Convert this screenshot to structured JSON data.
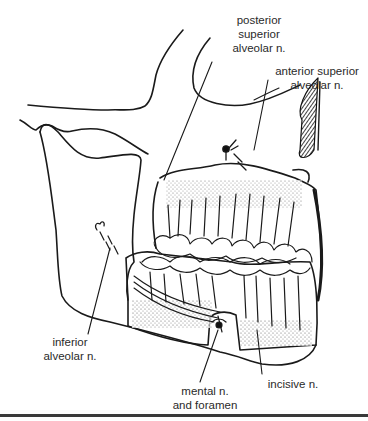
{
  "figure": {
    "labels": [
      {
        "id": "posterior_superior_alveolar",
        "lines": [
          "posterior",
          "superior",
          "alveolar n."
        ]
      },
      {
        "id": "anterior_superior_alveolar",
        "lines": [
          "anterior superior",
          "alveolar n."
        ]
      },
      {
        "id": "inferior_alveolar",
        "lines": [
          "inferior",
          "alveolar n."
        ]
      },
      {
        "id": "mental",
        "lines": [
          "mental n.",
          "and foramen"
        ]
      },
      {
        "id": "incisive",
        "lines": [
          "incisive n."
        ]
      }
    ]
  },
  "colors": {
    "line": "#1a1a1a",
    "text": "#2a2a2a",
    "background": "#ffffff"
  }
}
